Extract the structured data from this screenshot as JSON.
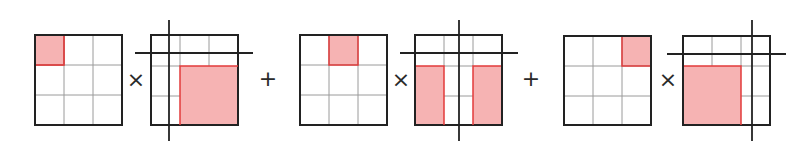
{
  "diagram": {
    "title": "",
    "colors": {
      "grid_outline": "#222222",
      "grid_inner": "#9a9a9a",
      "highlight_fill": "#f6b3b3",
      "highlight_stroke": "#e23b3b",
      "operator": "#2a2a2a",
      "crop_lines": "#222222"
    },
    "operators": [
      {
        "symbol": "×",
        "x": 136,
        "y": 81
      },
      {
        "symbol": "+",
        "x": 268,
        "y": 79
      },
      {
        "symbol": "×",
        "x": 401,
        "y": 81
      },
      {
        "symbol": "+",
        "x": 531,
        "y": 79
      },
      {
        "symbol": "×",
        "x": 668,
        "y": 81
      }
    ],
    "terms": [
      {
        "kernel": {
          "box": [
            35,
            35,
            122,
            125
          ],
          "highlight_cell": "top-left"
        },
        "shifted": {
          "box": [
            151,
            35,
            238,
            125
          ],
          "vline_x": 169,
          "hline_y": 53,
          "shaded": [
            [
              180,
              66,
              238,
              125
            ]
          ]
        }
      },
      {
        "kernel": {
          "box": [
            300,
            35,
            387,
            125
          ],
          "highlight_cell": "top-center"
        },
        "shifted": {
          "box": [
            415,
            35,
            502,
            125
          ],
          "vline_x": 459,
          "hline_y": 53,
          "shaded": [
            [
              415,
              66,
              444,
              125
            ],
            [
              473,
              66,
              502,
              125
            ]
          ]
        }
      },
      {
        "kernel": {
          "box": [
            564,
            36,
            651,
            125
          ],
          "highlight_cell": "top-right"
        },
        "shifted": {
          "box": [
            683,
            36,
            770,
            125
          ],
          "vline_x": 752,
          "hline_y": 54,
          "shaded": [
            [
              683,
              66,
              741,
              125
            ]
          ]
        }
      }
    ]
  }
}
